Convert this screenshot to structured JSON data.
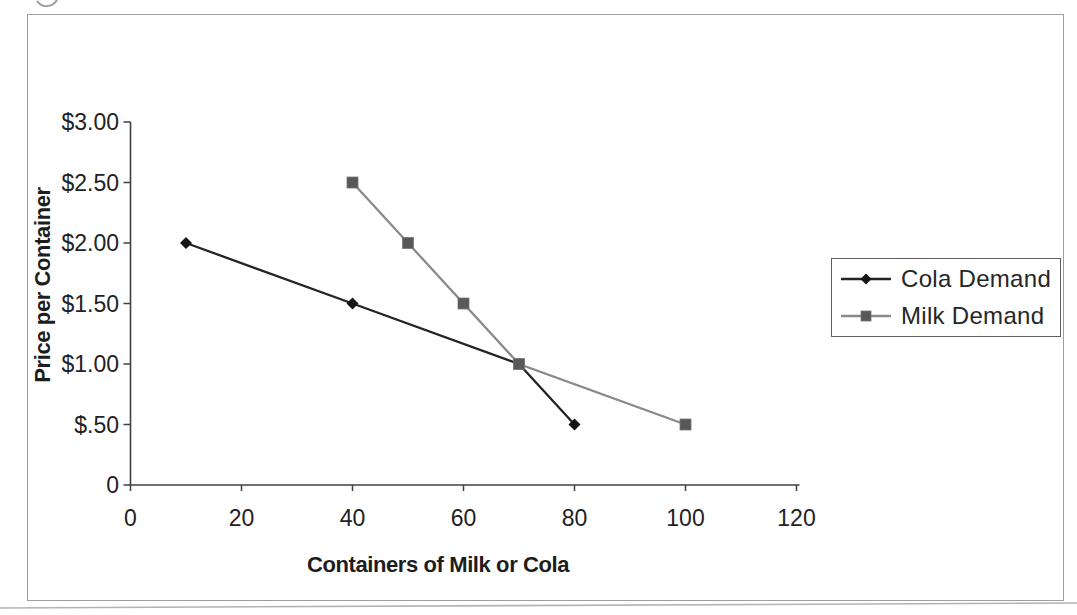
{
  "figure": {
    "background": "#ffffff",
    "frame_border_color": "#9e9e9e",
    "axis_color": "#3f3f3f",
    "text_color": "#222222",
    "legend_border_color": "#5f5f5f"
  },
  "chart_data": {
    "type": "line",
    "title": "",
    "xlabel": "Containers of Milk or Cola",
    "ylabel": "Price per Container",
    "xlim": [
      0,
      120
    ],
    "ylim": [
      0,
      3.0
    ],
    "grid": false,
    "legend_position": "middle-right",
    "x_ticks": [
      0,
      20,
      40,
      60,
      80,
      100,
      120
    ],
    "x_tick_labels": [
      "0",
      "20",
      "40",
      "60",
      "80",
      "100",
      "120"
    ],
    "y_ticks": [
      0,
      0.5,
      1.0,
      1.5,
      2.0,
      2.5,
      3.0
    ],
    "y_tick_labels": [
      "0",
      "$.50",
      "$1.00",
      "$1.50",
      "$2.00",
      "$2.50",
      "$3.00"
    ],
    "series": [
      {
        "name": "Cola Demand",
        "marker": "diamond",
        "line_color": "#242424",
        "marker_color": "#161616",
        "points": [
          [
            10,
            2.0
          ],
          [
            40,
            1.5
          ],
          [
            70,
            1.0
          ],
          [
            80,
            0.5
          ]
        ]
      },
      {
        "name": "Milk Demand",
        "marker": "square",
        "line_color": "#8a8a8a",
        "marker_color": "#585858",
        "points": [
          [
            40,
            2.5
          ],
          [
            50,
            2.0
          ],
          [
            60,
            1.5
          ],
          [
            70,
            1.0
          ],
          [
            100,
            0.5
          ]
        ]
      }
    ]
  }
}
